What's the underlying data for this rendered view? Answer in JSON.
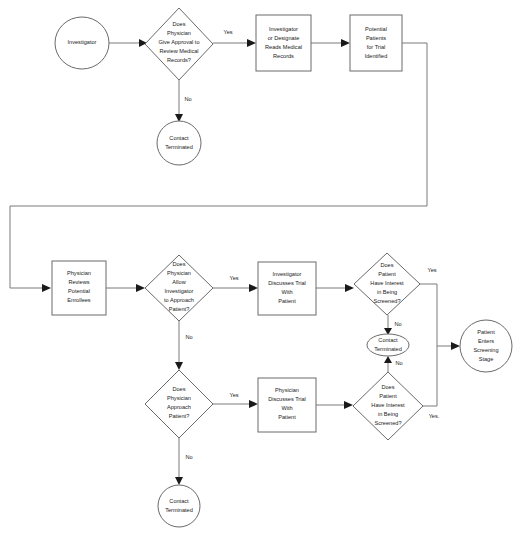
{
  "diagram": {
    "colors": {
      "background": "#ffffff",
      "shape_stroke": "#6a6a6a",
      "shape_fill": "#ffffff",
      "edge_stroke": "#7a7a7a",
      "arrow_fill": "#1a1a1a",
      "text": "#1a1a1a"
    },
    "nodes": [
      {
        "id": "investigator",
        "type": "circle",
        "lines": [
          "Investigator"
        ],
        "cx": 82,
        "cy": 43,
        "rx": 27,
        "ry": 26
      },
      {
        "id": "d-approval",
        "type": "diamond",
        "lines": [
          "Does",
          "Physician",
          "Give Approval to",
          "Review Medical",
          "Records?"
        ],
        "cx": 179,
        "cy": 44,
        "rx": 34,
        "ry": 36
      },
      {
        "id": "reads-records",
        "type": "rect",
        "lines": [
          "Investigator",
          "or Designate",
          "Reads Medical",
          "Records"
        ],
        "x": 256,
        "y": 15,
        "w": 55,
        "h": 56
      },
      {
        "id": "potential-patients",
        "type": "rect",
        "lines": [
          "Potential",
          "Patients",
          "for Trial",
          "Identified"
        ],
        "x": 350,
        "y": 15,
        "w": 52,
        "h": 56
      },
      {
        "id": "contact-terminated-1",
        "type": "circle",
        "lines": [
          "Contact",
          "Terminated"
        ],
        "cx": 179,
        "cy": 143,
        "rx": 22,
        "ry": 22
      },
      {
        "id": "physician-reviews",
        "type": "rect",
        "lines": [
          "Physician",
          "Reviews",
          "Potential",
          "Enrollees"
        ],
        "x": 52,
        "y": 261,
        "w": 54,
        "h": 54
      },
      {
        "id": "d-allow",
        "type": "diamond",
        "lines": [
          "Does",
          "Physician",
          "Allow",
          "Investigator",
          "to Approach",
          "Patient?"
        ],
        "cx": 179,
        "cy": 288,
        "rx": 34,
        "ry": 33
      },
      {
        "id": "investigator-discusses",
        "type": "rect",
        "lines": [
          "Investigator",
          "Discusses Trial",
          "With",
          "Patient"
        ],
        "x": 258,
        "y": 262,
        "w": 58,
        "h": 53
      },
      {
        "id": "d-interest-top",
        "type": "diamond",
        "lines": [
          "Does",
          "Patient",
          "Have Interest",
          "in Being",
          "Screened?"
        ],
        "cx": 387,
        "cy": 284,
        "rx": 33,
        "ry": 31
      },
      {
        "id": "contact-terminated-mid",
        "type": "ellipse",
        "lines": [
          "Contact",
          "Terminated"
        ],
        "cx": 388,
        "cy": 345,
        "rx": 21,
        "ry": 11
      },
      {
        "id": "d-approach",
        "type": "diamond",
        "lines": [
          "Does",
          "Physician",
          "Approach",
          "Patient?"
        ],
        "cx": 179,
        "cy": 404,
        "rx": 34,
        "ry": 34
      },
      {
        "id": "physician-discusses",
        "type": "rect",
        "lines": [
          "Physician",
          "Discusses Trial",
          "With",
          "Patient"
        ],
        "x": 258,
        "y": 378,
        "w": 58,
        "h": 54
      },
      {
        "id": "d-interest-bottom",
        "type": "diamond",
        "lines": [
          "Does",
          "Patient",
          "Have Interest",
          "in Being",
          "Screened?"
        ],
        "cx": 388,
        "cy": 406,
        "rx": 35,
        "ry": 34
      },
      {
        "id": "contact-terminated-2",
        "type": "circle",
        "lines": [
          "Contact",
          "Terminated"
        ],
        "cx": 179,
        "cy": 506,
        "rx": 21,
        "ry": 21
      },
      {
        "id": "patient-enters",
        "type": "circle",
        "lines": [
          "Patient",
          "Enters",
          "Screening",
          "Stage"
        ],
        "cx": 486,
        "cy": 346,
        "rx": 26,
        "ry": 26
      }
    ],
    "edges": [
      {
        "id": "e-investigator-approval",
        "label": "",
        "label_x": 0,
        "label_y": 0
      },
      {
        "id": "e-approval-yes",
        "label": "Yes",
        "label_x": 228,
        "label_y": 33
      },
      {
        "id": "e-reads-potential",
        "label": "",
        "label_x": 0,
        "label_y": 0
      },
      {
        "id": "e-approval-no",
        "label": "No",
        "label_x": 188,
        "label_y": 100
      },
      {
        "id": "e-potential-loop",
        "label": "",
        "label_x": 0,
        "label_y": 0
      },
      {
        "id": "e-reviews-allow",
        "label": "",
        "label_x": 0,
        "label_y": 0
      },
      {
        "id": "e-allow-yes",
        "label": "Yes",
        "label_x": 234,
        "label_y": 279
      },
      {
        "id": "e-allow-no",
        "label": "No",
        "label_x": 189,
        "label_y": 338
      },
      {
        "id": "e-discusses-interest",
        "label": "",
        "label_x": 0,
        "label_y": 0
      },
      {
        "id": "e-interest-top-no",
        "label": "No",
        "label_x": 397,
        "label_y": 325
      },
      {
        "id": "e-interest-top-yes",
        "label": "Yes",
        "label_x": 432,
        "label_y": 271
      },
      {
        "id": "e-approach-yes",
        "label": "Yes",
        "label_x": 234,
        "label_y": 396
      },
      {
        "id": "e-approach-no",
        "label": "No",
        "label_x": 189,
        "label_y": 458
      },
      {
        "id": "e-physdiscusses-interest",
        "label": "",
        "label_x": 0,
        "label_y": 0
      },
      {
        "id": "e-interest-bottom-no",
        "label": "No",
        "label_x": 398,
        "label_y": 364
      },
      {
        "id": "e-interest-bottom-yes",
        "label": "Yes.",
        "label_x": 434,
        "label_y": 417
      },
      {
        "id": "e-to-screening",
        "label": "",
        "label_x": 0,
        "label_y": 0
      }
    ]
  }
}
